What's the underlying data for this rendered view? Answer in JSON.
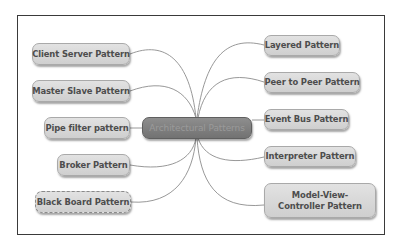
{
  "diagram": {
    "type": "mind-map",
    "colors": {
      "node_fill": "#d8d8d8",
      "node_border": "#a9a9a9",
      "node_text": "#4d4d4d",
      "center_fill": "#808080",
      "center_text": "#9a9a9a",
      "link": "#8c8c8c",
      "frame": "#3a3a3a"
    },
    "center": {
      "label": "Architectural Patterns"
    },
    "left_nodes": [
      {
        "label": "Client Server Pattern"
      },
      {
        "label": "Master Slave Pattern"
      },
      {
        "label": "Pipe filter pattern"
      },
      {
        "label": "Broker Pattern"
      },
      {
        "label": "Black Board Pattern"
      }
    ],
    "right_nodes": [
      {
        "label": "Layered Pattern"
      },
      {
        "label": "Peer to Peer Pattern"
      },
      {
        "label": "Event Bus Pattern"
      },
      {
        "label": "Interpreter Pattern"
      },
      {
        "label": "Model-View-Controller Pattern"
      }
    ]
  }
}
